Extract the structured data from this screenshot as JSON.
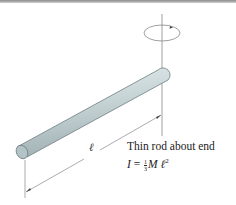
{
  "figure": {
    "caption": "Thin rod about end",
    "formula": {
      "lhs": "I",
      "equals": "=",
      "frac_num": "1",
      "frac_den": "3",
      "mass": "M",
      "length_symbol": "ℓ",
      "exponent": "2"
    },
    "length_label": "ℓ",
    "colors": {
      "rod_body": "#c9d6d8",
      "rod_edge": "#6f7f82",
      "rod_end": "#b3c4c7",
      "lines": "#777777",
      "text": "#222222"
    }
  }
}
